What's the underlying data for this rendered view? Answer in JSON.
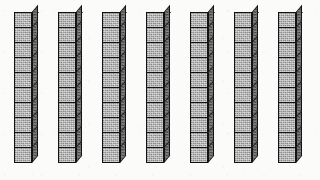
{
  "image": {
    "title": "Base ten blocks — seven tens rods",
    "background_color": "#fbfbfa",
    "width": 320,
    "height": 180
  },
  "manipulative": {
    "kind": "base-ten-blocks",
    "block_type": "tens-rod",
    "projection": "oblique-isometric",
    "rod_count": 7,
    "units_per_rod": 10,
    "total_units": 70,
    "represented_number": "70",
    "colors": {
      "front_face": "#a9a9a9",
      "top_face": "#8e8e8e",
      "right_face": "#636363",
      "outline": "#131313",
      "background": "#fbfbfa"
    },
    "geometry": {
      "unit_width": 18,
      "unit_height": 16,
      "depth": 6,
      "rod_top_y": 12,
      "rod_pitch_x": 44,
      "first_rod_x": 14
    },
    "rods": [
      {
        "index": 1,
        "label": "tens-rod-1",
        "x": 14,
        "units": 10,
        "value": 10
      },
      {
        "index": 2,
        "label": "tens-rod-2",
        "x": 58,
        "units": 10,
        "value": 10
      },
      {
        "index": 3,
        "label": "tens-rod-3",
        "x": 102,
        "units": 10,
        "value": 10
      },
      {
        "index": 4,
        "label": "tens-rod-4",
        "x": 146,
        "units": 10,
        "value": 10
      },
      {
        "index": 5,
        "label": "tens-rod-5",
        "x": 190,
        "units": 10,
        "value": 10
      },
      {
        "index": 6,
        "label": "tens-rod-6",
        "x": 234,
        "units": 10,
        "value": 10
      },
      {
        "index": 7,
        "label": "tens-rod-7",
        "x": 278,
        "units": 10,
        "value": 10
      }
    ]
  }
}
